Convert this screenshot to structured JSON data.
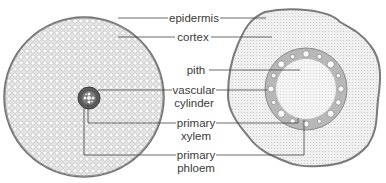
{
  "diagram": {
    "labels": {
      "epidermis": "epidermis",
      "cortex": "cortex",
      "pith": "pith",
      "vascular_cylinder_line1": "vascular",
      "vascular_cylinder_line2": "cylinder",
      "primary_xylem_line1": "primary",
      "primary_xylem_line2": "xylem",
      "primary_phloem_line1": "primary",
      "primary_phloem_line2": "phloem"
    },
    "colors": {
      "tissue_fill": "#e9e9e9",
      "cell_stroke": "#9a9a9a",
      "edge": "#6a6a6a",
      "stele_dark": "#555555",
      "leader_line": "#444444",
      "text": "#3a3a3a"
    }
  }
}
